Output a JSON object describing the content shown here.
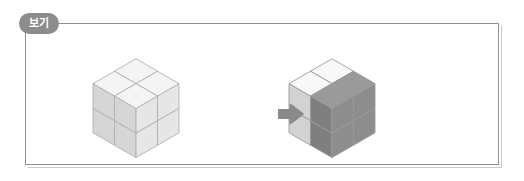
{
  "figure": {
    "badge_label": "보기",
    "badge_color": "#8c8c8c",
    "panel_border_color": "#8e8e8e",
    "background_color": "#ffffff",
    "arrow_icon": "arrow-right-icon",
    "arrow_color": "#8a8a8a",
    "caption": ""
  },
  "diagram_data": {
    "type": "isometric-cube-figure",
    "description": "A 2x2x2 cube assembly shown plain on the left, and the same assembly on the right with one 1x2x2 sub-block shaded dark gray.",
    "shapes": [
      {
        "id": "left-solid",
        "label": "",
        "role": "before",
        "dimensions": {
          "width": 2,
          "depth": 2,
          "height": 2
        },
        "unit_cube_count": 8,
        "face_colors": {
          "top": "#f4f4f4",
          "left": "#d6d6d6",
          "right": "#e6e6e6"
        },
        "edge_color": "#b0b0b0",
        "highlight_cubes": []
      },
      {
        "id": "right-solid",
        "label": "",
        "role": "after",
        "dimensions": {
          "width": 2,
          "depth": 2,
          "height": 2
        },
        "unit_cube_count": 8,
        "face_colors": {
          "top": "#f8f8f8",
          "left": "#d2d2d2",
          "right": "#e4e4e4"
        },
        "highlight_face_colors": {
          "top": "#9a9a9a",
          "left": "#7f7f7f",
          "right": "#8d8d8d"
        },
        "edge_color": "#9a9a9a",
        "highlight_cubes": [
          "right-front-top",
          "right-front-bottom",
          "right-back-top",
          "right-back-bottom"
        ],
        "highlight_cube_count": 4
      }
    ],
    "transition": {
      "from": "left-solid",
      "to": "right-solid",
      "symbol": "→"
    }
  }
}
